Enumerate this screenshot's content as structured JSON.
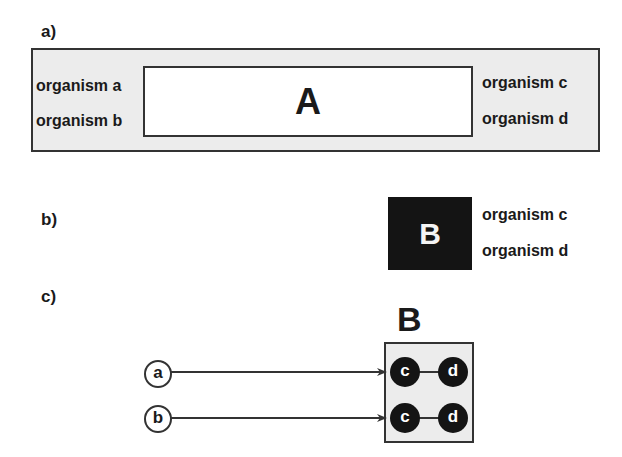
{
  "panel_a": {
    "label": "a)",
    "inner_title": "A",
    "left_organisms": [
      "organism a",
      "organism b"
    ],
    "right_organisms": [
      "organism c",
      "organism d"
    ]
  },
  "panel_b": {
    "label": "b)",
    "box_title": "B",
    "organisms": [
      "organism c",
      "organism d"
    ]
  },
  "panel_c": {
    "label": "c)",
    "box_title": "B",
    "sources": [
      "a",
      "b"
    ],
    "rows": [
      {
        "left": "c",
        "right": "d"
      },
      {
        "left": "c",
        "right": "d"
      }
    ]
  },
  "colors": {
    "box_fill": "#ececec",
    "stroke": "#333333",
    "node_fill": "#141414"
  }
}
